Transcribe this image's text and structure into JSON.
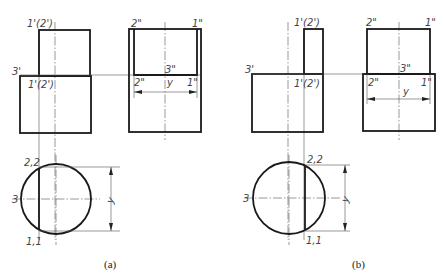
{
  "figure": {
    "panels": [
      {
        "id": "a",
        "caption": "(a)",
        "front_view": {
          "labels": {
            "top": "1'(2')",
            "mid": "1'(2')",
            "left": "3'"
          }
        },
        "side_view": {
          "labels": {
            "top_left": "2\"",
            "top_right": "1\"",
            "mid_center": "3\"",
            "mid_left": "2\"",
            "mid_right": "1\"",
            "dimension": "y"
          }
        },
        "top_view": {
          "labels": {
            "top": "2,2",
            "left": "3",
            "bottom": "1,1",
            "dimension": "y"
          }
        }
      },
      {
        "id": "b",
        "caption": "(b)",
        "front_view": {
          "labels": {
            "top": "1'(2')",
            "mid": "1'(2')",
            "left": "3'"
          }
        },
        "side_view": {
          "labels": {
            "top_left": "2\"",
            "top_right": "1\"",
            "mid_center": "3\"",
            "mid_left": "2\"",
            "mid_right": "1\"",
            "dimension": "y"
          }
        },
        "top_view": {
          "labels": {
            "top": "2,2",
            "left": "3",
            "bottom": "1,1",
            "dimension": "y"
          }
        }
      }
    ]
  }
}
